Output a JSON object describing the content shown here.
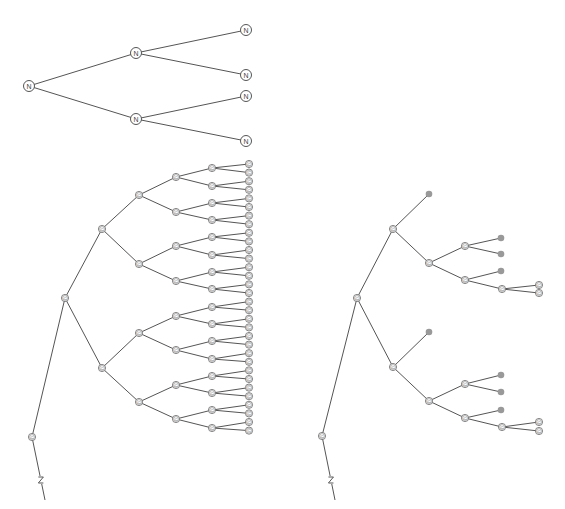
{
  "diagram": {
    "colors": {
      "edge": "#555555",
      "node_fill": "#ffffff",
      "pruned_fill": "#999999"
    },
    "top_tree": {
      "label": "N",
      "nodes": [
        {
          "id": "r",
          "x": 29,
          "y": 86
        },
        {
          "id": "a",
          "x": 136,
          "y": 53
        },
        {
          "id": "b",
          "x": 136,
          "y": 119
        },
        {
          "id": "a1",
          "x": 246,
          "y": 30
        },
        {
          "id": "a2",
          "x": 246,
          "y": 75
        },
        {
          "id": "b1",
          "x": 246,
          "y": 96
        },
        {
          "id": "b2",
          "x": 246,
          "y": 141
        }
      ],
      "edges": [
        [
          "r",
          "a"
        ],
        [
          "r",
          "b"
        ],
        [
          "a",
          "a1"
        ],
        [
          "a",
          "a2"
        ],
        [
          "b",
          "b1"
        ],
        [
          "b",
          "b2"
        ]
      ]
    },
    "left_tree": {
      "label": "C",
      "root": {
        "x": 32,
        "y": 437
      },
      "break_tail": {
        "x1": 32,
        "y1": 437,
        "x2": 45,
        "y2": 500,
        "mark_y": 480
      },
      "level1": {
        "x": 65,
        "y": 298
      },
      "level2": {
        "x": 102,
        "ys": [
          229,
          368
        ]
      },
      "level3": {
        "x": 139,
        "ys": [
          195,
          264,
          333,
          402
        ]
      },
      "level4": {
        "x": 176,
        "ys": [
          177,
          212,
          246,
          281,
          316,
          350,
          385,
          419
        ]
      },
      "level5": {
        "x": 212,
        "ys": [
          168,
          186,
          203,
          220,
          237,
          255,
          272,
          289,
          307,
          324,
          341,
          359,
          376,
          393,
          410,
          428
        ]
      },
      "level6": {
        "x": 249,
        "spacing": 8.6,
        "start": 164
      }
    },
    "right_tree": {
      "label": "C",
      "nodes": [
        {
          "id": "r",
          "x": 322,
          "y": 436,
          "t": "n"
        },
        {
          "id": "m",
          "x": 357,
          "y": 298,
          "t": "n"
        },
        {
          "id": "u",
          "x": 393,
          "y": 229,
          "t": "n"
        },
        {
          "id": "d",
          "x": 393,
          "y": 367,
          "t": "n"
        },
        {
          "id": "up",
          "x": 429,
          "y": 194,
          "t": "p"
        },
        {
          "id": "uc",
          "x": 429,
          "y": 263,
          "t": "n"
        },
        {
          "id": "uc1",
          "x": 465,
          "y": 246,
          "t": "n"
        },
        {
          "id": "uc2",
          "x": 465,
          "y": 280,
          "t": "n"
        },
        {
          "id": "uc1a",
          "x": 501,
          "y": 238,
          "t": "p"
        },
        {
          "id": "uc1b",
          "x": 501,
          "y": 254,
          "t": "p"
        },
        {
          "id": "uc2a",
          "x": 501,
          "y": 271,
          "t": "p"
        },
        {
          "id": "uc2b",
          "x": 502,
          "y": 289,
          "t": "n"
        },
        {
          "id": "uc2b1",
          "x": 539,
          "y": 285,
          "t": "n"
        },
        {
          "id": "uc2b2",
          "x": 539,
          "y": 293,
          "t": "n"
        },
        {
          "id": "dp",
          "x": 429,
          "y": 332,
          "t": "p"
        },
        {
          "id": "dc",
          "x": 429,
          "y": 401,
          "t": "n"
        },
        {
          "id": "dc1",
          "x": 465,
          "y": 384,
          "t": "n"
        },
        {
          "id": "dc2",
          "x": 465,
          "y": 418,
          "t": "n"
        },
        {
          "id": "dc1a",
          "x": 501,
          "y": 375,
          "t": "p"
        },
        {
          "id": "dc1b",
          "x": 501,
          "y": 392,
          "t": "p"
        },
        {
          "id": "dc2a",
          "x": 501,
          "y": 410,
          "t": "p"
        },
        {
          "id": "dc2b",
          "x": 502,
          "y": 427,
          "t": "n"
        },
        {
          "id": "dc2b1",
          "x": 539,
          "y": 422,
          "t": "n"
        },
        {
          "id": "dc2b2",
          "x": 539,
          "y": 431,
          "t": "n"
        }
      ],
      "edges": [
        [
          "r",
          "m"
        ],
        [
          "m",
          "u"
        ],
        [
          "m",
          "d"
        ],
        [
          "u",
          "up"
        ],
        [
          "u",
          "uc"
        ],
        [
          "uc",
          "uc1"
        ],
        [
          "uc",
          "uc2"
        ],
        [
          "uc1",
          "uc1a"
        ],
        [
          "uc1",
          "uc1b"
        ],
        [
          "uc2",
          "uc2a"
        ],
        [
          "uc2",
          "uc2b"
        ],
        [
          "uc2b",
          "uc2b1"
        ],
        [
          "uc2b",
          "uc2b2"
        ],
        [
          "d",
          "dp"
        ],
        [
          "d",
          "dc"
        ],
        [
          "dc",
          "dc1"
        ],
        [
          "dc",
          "dc2"
        ],
        [
          "dc1",
          "dc1a"
        ],
        [
          "dc1",
          "dc1b"
        ],
        [
          "dc2",
          "dc2a"
        ],
        [
          "dc2",
          "dc2b"
        ],
        [
          "dc2b",
          "dc2b1"
        ],
        [
          "dc2b",
          "dc2b2"
        ]
      ],
      "break_tail": {
        "x1": 322,
        "y1": 436,
        "x2": 335,
        "y2": 500,
        "mark_y": 480
      }
    }
  }
}
